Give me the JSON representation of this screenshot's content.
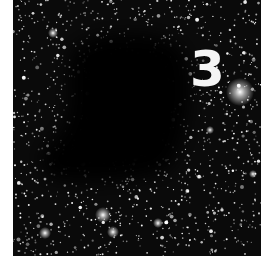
{
  "image": {
    "subject": "dark nebula against dense star field",
    "label": "3",
    "colors": {
      "sky": "#0a0a0a",
      "stars": "#ffffff",
      "label": "#f4f4f4",
      "background": "#ffffff"
    }
  }
}
